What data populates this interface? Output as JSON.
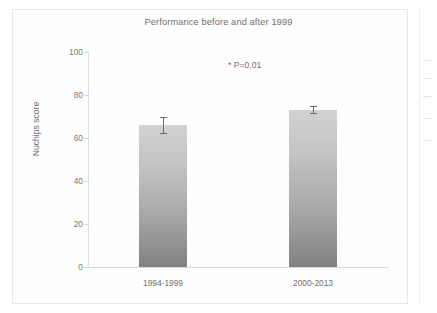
{
  "figure": {
    "title": "Performance before and after 1999",
    "annotation": "* P=0.01",
    "edge_ticks": [
      60,
      78,
      96,
      118,
      140
    ],
    "bar_color_top": "#d2d2d2",
    "bar_color_bottom": "#808080",
    "text_color": "#6f6f6f"
  },
  "chart_data": {
    "type": "bar",
    "title": "Performance before and after 1999",
    "xlabel": "",
    "ylabel": "Nuchips score",
    "categories": [
      "1994-1999",
      "2000-2013"
    ],
    "values": [
      66,
      73
    ],
    "errors": [
      4,
      2
    ],
    "ylim": [
      0,
      100
    ],
    "yticks": [
      0,
      20,
      40,
      60,
      80,
      100
    ],
    "ytick_labels": [
      "0",
      "20",
      "40",
      "60",
      "80",
      "100"
    ],
    "grid": false,
    "legend": false,
    "annotations": [
      {
        "text": "* P=0.01",
        "x": 0.5,
        "y": 92
      }
    ]
  }
}
